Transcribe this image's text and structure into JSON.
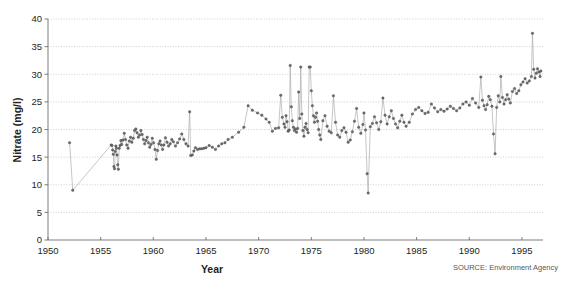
{
  "figure": {
    "background_color": "#ffffff",
    "source_note": "SOURCE: Environment Agency"
  },
  "chart_data": {
    "type": "line",
    "title": "",
    "subtitle": "",
    "xlabel": "Year",
    "ylabel": "Nitrate (mg/l)",
    "xlim": [
      1950,
      1997
    ],
    "ylim": [
      0,
      40
    ],
    "xticks": [
      1950,
      1955,
      1960,
      1965,
      1970,
      1975,
      1980,
      1985,
      1990,
      1995
    ],
    "yticks": [
      0,
      5,
      10,
      15,
      20,
      25,
      30,
      35,
      40
    ],
    "xtick_labels": [
      "1950",
      "1955",
      "1960",
      "1965",
      "1970",
      "1975",
      "1980",
      "1985",
      "1990",
      "1995"
    ],
    "ytick_labels": [
      "0",
      "5",
      "10",
      "15",
      "20",
      "25",
      "30",
      "35",
      "40"
    ],
    "grid": true,
    "grid_axis": "y",
    "legend": false,
    "legend_position": "none",
    "marker": "circle",
    "line_color": "#a7a7a9",
    "marker_color": "#6e6f71",
    "annotations": [
      "SOURCE: Environment Agency"
    ],
    "series": [
      {
        "name": "Nitrate concentration",
        "units": "mg/l",
        "points": [
          [
            1952.05,
            17.6
          ],
          [
            1952.35,
            9.0
          ],
          [
            1956.0,
            17.2
          ],
          [
            1956.08,
            17.1
          ],
          [
            1956.14,
            16.3
          ],
          [
            1956.2,
            15.5
          ],
          [
            1956.26,
            13.3
          ],
          [
            1956.32,
            12.9
          ],
          [
            1956.38,
            16.0
          ],
          [
            1956.44,
            17.0
          ],
          [
            1956.5,
            16.6
          ],
          [
            1956.56,
            15.4
          ],
          [
            1956.62,
            13.6
          ],
          [
            1956.68,
            12.8
          ],
          [
            1956.76,
            16.6
          ],
          [
            1956.84,
            17.1
          ],
          [
            1956.92,
            18.0
          ],
          [
            1957.0,
            17.3
          ],
          [
            1957.12,
            18.1
          ],
          [
            1957.24,
            19.3
          ],
          [
            1957.36,
            18.2
          ],
          [
            1957.48,
            17.2
          ],
          [
            1957.6,
            16.6
          ],
          [
            1957.72,
            17.9
          ],
          [
            1957.84,
            18.6
          ],
          [
            1957.96,
            17.7
          ],
          [
            1958.1,
            18.4
          ],
          [
            1958.22,
            19.8
          ],
          [
            1958.34,
            20.1
          ],
          [
            1958.46,
            19.4
          ],
          [
            1958.58,
            18.6
          ],
          [
            1958.7,
            19.0
          ],
          [
            1958.82,
            19.8
          ],
          [
            1958.94,
            19.1
          ],
          [
            1959.06,
            18.2
          ],
          [
            1959.18,
            17.4
          ],
          [
            1959.3,
            18.0
          ],
          [
            1959.42,
            18.6
          ],
          [
            1959.54,
            17.6
          ],
          [
            1959.66,
            16.8
          ],
          [
            1959.78,
            17.3
          ],
          [
            1959.9,
            18.4
          ],
          [
            1960.02,
            17.6
          ],
          [
            1960.16,
            16.4
          ],
          [
            1960.28,
            14.6
          ],
          [
            1960.4,
            16.2
          ],
          [
            1960.52,
            17.4
          ],
          [
            1960.64,
            17.9
          ],
          [
            1960.76,
            17.2
          ],
          [
            1960.88,
            16.4
          ],
          [
            1961.0,
            17.2
          ],
          [
            1961.15,
            18.5
          ],
          [
            1961.3,
            17.7
          ],
          [
            1961.45,
            17.0
          ],
          [
            1961.6,
            17.4
          ],
          [
            1961.75,
            18.2
          ],
          [
            1961.9,
            17.8
          ],
          [
            1962.1,
            17.0
          ],
          [
            1962.3,
            17.6
          ],
          [
            1962.5,
            18.3
          ],
          [
            1962.7,
            19.2
          ],
          [
            1962.9,
            18.2
          ],
          [
            1963.1,
            17.4
          ],
          [
            1963.3,
            17.0
          ],
          [
            1963.45,
            23.2
          ],
          [
            1963.55,
            15.3
          ],
          [
            1963.7,
            15.4
          ],
          [
            1963.85,
            16.1
          ],
          [
            1964.0,
            16.7
          ],
          [
            1964.2,
            16.4
          ],
          [
            1964.4,
            16.5
          ],
          [
            1964.6,
            16.5
          ],
          [
            1964.8,
            16.6
          ],
          [
            1965.0,
            16.7
          ],
          [
            1965.3,
            17.1
          ],
          [
            1965.6,
            16.8
          ],
          [
            1965.9,
            16.4
          ],
          [
            1966.2,
            17.0
          ],
          [
            1966.5,
            17.4
          ],
          [
            1966.8,
            17.6
          ],
          [
            1967.1,
            18.2
          ],
          [
            1967.5,
            18.6
          ],
          [
            1968.1,
            19.5
          ],
          [
            1968.6,
            20.4
          ],
          [
            1969.0,
            24.3
          ],
          [
            1969.4,
            23.5
          ],
          [
            1969.9,
            23.0
          ],
          [
            1970.3,
            22.6
          ],
          [
            1970.7,
            21.9
          ],
          [
            1971.0,
            21.3
          ],
          [
            1971.3,
            19.7
          ],
          [
            1971.6,
            20.2
          ],
          [
            1971.9,
            20.3
          ],
          [
            1972.1,
            26.2
          ],
          [
            1972.25,
            22.2
          ],
          [
            1972.4,
            21.0
          ],
          [
            1972.5,
            20.4
          ],
          [
            1972.6,
            22.5
          ],
          [
            1972.7,
            21.4
          ],
          [
            1972.8,
            19.7
          ],
          [
            1972.9,
            19.9
          ],
          [
            1973.0,
            31.6
          ],
          [
            1973.1,
            24.1
          ],
          [
            1973.2,
            21.6
          ],
          [
            1973.3,
            20.4
          ],
          [
            1973.4,
            19.8
          ],
          [
            1973.5,
            20.1
          ],
          [
            1973.6,
            19.5
          ],
          [
            1973.7,
            20.2
          ],
          [
            1973.8,
            26.8
          ],
          [
            1973.9,
            22.0
          ],
          [
            1974.0,
            31.3
          ],
          [
            1974.1,
            22.8
          ],
          [
            1974.2,
            19.8
          ],
          [
            1974.3,
            18.8
          ],
          [
            1974.4,
            20.4
          ],
          [
            1974.5,
            21.1
          ],
          [
            1974.6,
            20.0
          ],
          [
            1974.7,
            19.4
          ],
          [
            1974.8,
            31.3
          ],
          [
            1974.9,
            31.3
          ],
          [
            1975.0,
            27.0
          ],
          [
            1975.1,
            24.3
          ],
          [
            1975.2,
            22.5
          ],
          [
            1975.3,
            21.3
          ],
          [
            1975.4,
            22.2
          ],
          [
            1975.5,
            23.0
          ],
          [
            1975.6,
            21.5
          ],
          [
            1975.7,
            20.0
          ],
          [
            1975.8,
            19.0
          ],
          [
            1975.9,
            18.2
          ],
          [
            1976.1,
            21.6
          ],
          [
            1976.3,
            22.5
          ],
          [
            1976.5,
            20.6
          ],
          [
            1976.7,
            19.7
          ],
          [
            1976.9,
            19.4
          ],
          [
            1977.1,
            26.1
          ],
          [
            1977.3,
            21.3
          ],
          [
            1977.5,
            19.0
          ],
          [
            1977.7,
            18.6
          ],
          [
            1977.9,
            19.8
          ],
          [
            1978.1,
            20.3
          ],
          [
            1978.3,
            19.5
          ],
          [
            1978.5,
            17.7
          ],
          [
            1978.7,
            18.1
          ],
          [
            1978.9,
            19.6
          ],
          [
            1979.1,
            21.5
          ],
          [
            1979.3,
            23.8
          ],
          [
            1979.5,
            20.4
          ],
          [
            1979.7,
            19.3
          ],
          [
            1979.9,
            20.9
          ],
          [
            1980.0,
            23.0
          ],
          [
            1980.15,
            19.9
          ],
          [
            1980.3,
            12.0
          ],
          [
            1980.4,
            8.5
          ],
          [
            1980.6,
            20.5
          ],
          [
            1980.8,
            21.1
          ],
          [
            1981.0,
            22.3
          ],
          [
            1981.2,
            21.2
          ],
          [
            1981.4,
            20.0
          ],
          [
            1981.6,
            21.4
          ],
          [
            1981.8,
            25.7
          ],
          [
            1982.0,
            22.6
          ],
          [
            1982.2,
            21.0
          ],
          [
            1982.4,
            22.3
          ],
          [
            1982.6,
            23.4
          ],
          [
            1982.8,
            22.0
          ],
          [
            1983.0,
            21.0
          ],
          [
            1983.2,
            20.3
          ],
          [
            1983.4,
            21.5
          ],
          [
            1983.6,
            22.6
          ],
          [
            1983.8,
            21.3
          ],
          [
            1984.0,
            20.6
          ],
          [
            1984.3,
            21.3
          ],
          [
            1984.6,
            22.8
          ],
          [
            1984.9,
            23.6
          ],
          [
            1985.2,
            24.0
          ],
          [
            1985.5,
            23.4
          ],
          [
            1985.8,
            22.9
          ],
          [
            1986.1,
            23.1
          ],
          [
            1986.4,
            24.6
          ],
          [
            1986.7,
            23.9
          ],
          [
            1987.0,
            23.2
          ],
          [
            1987.3,
            23.6
          ],
          [
            1987.6,
            23.3
          ],
          [
            1987.9,
            23.7
          ],
          [
            1988.2,
            24.2
          ],
          [
            1988.5,
            23.8
          ],
          [
            1988.8,
            23.4
          ],
          [
            1989.1,
            23.9
          ],
          [
            1989.4,
            24.6
          ],
          [
            1989.7,
            25.0
          ],
          [
            1990.0,
            24.4
          ],
          [
            1990.3,
            25.6
          ],
          [
            1990.6,
            24.8
          ],
          [
            1990.9,
            24.0
          ],
          [
            1991.1,
            29.5
          ],
          [
            1991.25,
            25.3
          ],
          [
            1991.4,
            24.3
          ],
          [
            1991.55,
            23.6
          ],
          [
            1991.7,
            24.5
          ],
          [
            1991.85,
            26.0
          ],
          [
            1992.0,
            25.4
          ],
          [
            1992.15,
            24.2
          ],
          [
            1992.3,
            19.2
          ],
          [
            1992.45,
            15.6
          ],
          [
            1992.6,
            24.0
          ],
          [
            1992.75,
            26.1
          ],
          [
            1992.9,
            25.0
          ],
          [
            1993.0,
            29.6
          ],
          [
            1993.15,
            25.8
          ],
          [
            1993.3,
            24.6
          ],
          [
            1993.45,
            25.4
          ],
          [
            1993.6,
            26.3
          ],
          [
            1993.75,
            25.5
          ],
          [
            1993.9,
            24.8
          ],
          [
            1994.1,
            26.9
          ],
          [
            1994.3,
            27.4
          ],
          [
            1994.5,
            26.5
          ],
          [
            1994.7,
            27.0
          ],
          [
            1994.9,
            28.1
          ],
          [
            1995.1,
            28.6
          ],
          [
            1995.3,
            29.2
          ],
          [
            1995.5,
            28.4
          ],
          [
            1995.7,
            28.8
          ],
          [
            1995.9,
            29.6
          ],
          [
            1996.0,
            37.4
          ],
          [
            1996.12,
            30.9
          ],
          [
            1996.24,
            29.3
          ],
          [
            1996.36,
            30.2
          ],
          [
            1996.48,
            31.0
          ],
          [
            1996.6,
            30.4
          ],
          [
            1996.72,
            29.6
          ],
          [
            1996.8,
            30.6
          ]
        ]
      }
    ]
  }
}
